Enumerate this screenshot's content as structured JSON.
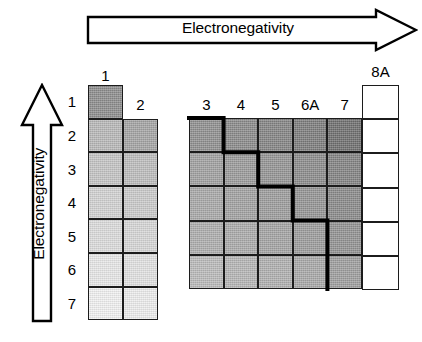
{
  "figure": {
    "top_arrow": {
      "label": "Electronegativity",
      "direction": "right"
    },
    "left_arrow": {
      "label": "Electronegativity",
      "direction": "up"
    }
  },
  "axes": {
    "group_labels": [
      "1",
      "2",
      "3",
      "4",
      "5",
      "6A",
      "7",
      "8A"
    ],
    "period_labels": [
      "1",
      "2",
      "3",
      "4",
      "5",
      "6",
      "7"
    ]
  },
  "chart_data": {
    "type": "heatmap",
    "title": "Electronegativity",
    "xlabel": "Electronegativity",
    "ylabel": "Electronegativity",
    "grid": true,
    "legend": "none",
    "x_note": "Electronegativity increases left to right",
    "y_note": "Electronegativity increases bottom to top",
    "categories": [
      "1",
      "2",
      "3",
      "4",
      "5",
      "6A",
      "7",
      "8A"
    ],
    "rows": [
      "1",
      "2",
      "3",
      "4",
      "5",
      "6",
      "7"
    ],
    "colorscale": {
      "description": "darker gray = higher electronegativity",
      "min_hex": "#f4f4f4",
      "max_hex": "#6e6e6e"
    },
    "cells": [
      {
        "group": "1",
        "period": "1",
        "shade": "#8d8d8d",
        "value": 2.1
      },
      {
        "group": "1",
        "period": "2",
        "shade": "#b8b8b8",
        "value": 1.0
      },
      {
        "group": "1",
        "period": "3",
        "shade": "#c4c4c4",
        "value": 0.9
      },
      {
        "group": "1",
        "period": "4",
        "shade": "#d2d2d2",
        "value": 0.8
      },
      {
        "group": "1",
        "period": "5",
        "shade": "#dcdcdc",
        "value": 0.8
      },
      {
        "group": "1",
        "period": "6",
        "shade": "#e8e8e8",
        "value": 0.8
      },
      {
        "group": "1",
        "period": "7",
        "shade": "#f2f2f2",
        "value": 0.7
      },
      {
        "group": "2",
        "period": "2",
        "shade": "#a4a4a4",
        "value": 1.5
      },
      {
        "group": "2",
        "period": "3",
        "shade": "#bdbdbd",
        "value": 1.2
      },
      {
        "group": "2",
        "period": "4",
        "shade": "#cbcbcb",
        "value": 1.0
      },
      {
        "group": "2",
        "period": "5",
        "shade": "#d6d6d6",
        "value": 1.0
      },
      {
        "group": "2",
        "period": "6",
        "shade": "#e2e2e2",
        "value": 0.9
      },
      {
        "group": "2",
        "period": "7",
        "shade": "#eeeeee",
        "value": 0.9
      },
      {
        "group": "3",
        "period": "2",
        "shade": "#8f8f8f",
        "value": 2.0
      },
      {
        "group": "3",
        "period": "3",
        "shade": "#a0a0a0",
        "value": 1.5
      },
      {
        "group": "3",
        "period": "4",
        "shade": "#a8a8a8",
        "value": 1.6
      },
      {
        "group": "3",
        "period": "5",
        "shade": "#aeaeae",
        "value": 1.7
      },
      {
        "group": "3",
        "period": "6",
        "shade": "#bababa",
        "value": 1.8
      },
      {
        "group": "4",
        "period": "2",
        "shade": "#8a8a8a",
        "value": 2.5
      },
      {
        "group": "4",
        "period": "3",
        "shade": "#9a9a9a",
        "value": 1.8
      },
      {
        "group": "4",
        "period": "4",
        "shade": "#a2a2a2",
        "value": 1.8
      },
      {
        "group": "4",
        "period": "5",
        "shade": "#aaaaaa",
        "value": 1.8
      },
      {
        "group": "4",
        "period": "6",
        "shade": "#b6b6b6",
        "value": 1.8
      },
      {
        "group": "5",
        "period": "2",
        "shade": "#848484",
        "value": 3.0
      },
      {
        "group": "5",
        "period": "3",
        "shade": "#949494",
        "value": 2.1
      },
      {
        "group": "5",
        "period": "4",
        "shade": "#9c9c9c",
        "value": 2.0
      },
      {
        "group": "5",
        "period": "5",
        "shade": "#a4a4a4",
        "value": 1.9
      },
      {
        "group": "5",
        "period": "6",
        "shade": "#b0b0b0",
        "value": 1.9
      },
      {
        "group": "6A",
        "period": "2",
        "shade": "#7c7c7c",
        "value": 3.5
      },
      {
        "group": "6A",
        "period": "3",
        "shade": "#8c8c8c",
        "value": 2.5
      },
      {
        "group": "6A",
        "period": "4",
        "shade": "#949494",
        "value": 2.4
      },
      {
        "group": "6A",
        "period": "5",
        "shade": "#9c9c9c",
        "value": 2.1
      },
      {
        "group": "6A",
        "period": "6",
        "shade": "#a8a8a8",
        "value": 2.0
      },
      {
        "group": "7",
        "period": "2",
        "shade": "#6e6e6e",
        "value": 4.0
      },
      {
        "group": "7",
        "period": "3",
        "shade": "#828282",
        "value": 3.0
      },
      {
        "group": "7",
        "period": "4",
        "shade": "#8a8a8a",
        "value": 2.8
      },
      {
        "group": "7",
        "period": "5",
        "shade": "#929292",
        "value": 2.5
      },
      {
        "group": "7",
        "period": "6",
        "shade": "#9e9e9e",
        "value": 2.2
      },
      {
        "group": "8A",
        "period": "1",
        "shade": "#ffffff",
        "value": null
      },
      {
        "group": "8A",
        "period": "2",
        "shade": "#ffffff",
        "value": null
      },
      {
        "group": "8A",
        "period": "3",
        "shade": "#ffffff",
        "value": null
      },
      {
        "group": "8A",
        "period": "4",
        "shade": "#ffffff",
        "value": null
      },
      {
        "group": "8A",
        "period": "5",
        "shade": "#ffffff",
        "value": null
      },
      {
        "group": "8A",
        "period": "6",
        "shade": "#ffffff",
        "value": null
      }
    ],
    "staircase": {
      "label": "metalloid-divider",
      "stroke_hex": "#000000",
      "stroke_width": 4
    }
  },
  "geometry": {
    "left_block": {
      "x": 88,
      "y": 85,
      "cell_w": 35,
      "cell_h": 33.6,
      "cols": 2,
      "rows": 7
    },
    "right_block": {
      "x": 189,
      "y": 118,
      "cell_w": 34.6,
      "cell_h": 34.2,
      "cols": 5,
      "rows": 5
    },
    "noble_block": {
      "x": 362,
      "y": 85,
      "cell_w": 37,
      "cell_h": 34.2,
      "rows": 6
    },
    "header_y": {
      "g1": 68,
      "g2": 97,
      "g3_7": 97,
      "g8a": 64
    },
    "row_label_x": 80
  }
}
